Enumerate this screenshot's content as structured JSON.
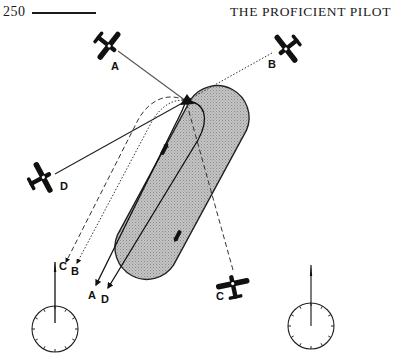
{
  "page": {
    "number": "250",
    "running_head": "THE PROFICIENT PILOT"
  },
  "diagram": {
    "aircraft": [
      {
        "id": "A",
        "label": "A",
        "path_style": "solid-gray"
      },
      {
        "id": "B",
        "label": "B",
        "path_style": "dotted"
      },
      {
        "id": "C",
        "label": "C",
        "path_style": "dashed"
      },
      {
        "id": "D",
        "label": "D",
        "path_style": "solid"
      }
    ],
    "exit_labels": [
      "A",
      "B",
      "C",
      "D"
    ],
    "heading_indicators": [
      {
        "id": "left",
        "ticks": 12
      },
      {
        "id": "right",
        "ticks": 12
      }
    ],
    "colors": {
      "ink": "#1a1a1a",
      "shaded_area": "#b9b9b9",
      "background": "#ffffff"
    }
  }
}
